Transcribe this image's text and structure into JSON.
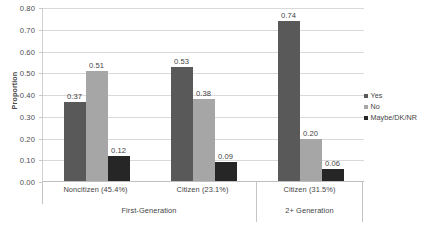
{
  "chart_data": {
    "type": "bar",
    "title": "",
    "subtitle": "",
    "xlabel": "",
    "ylabel": "Proportion",
    "ylim": [
      0.0,
      0.8
    ],
    "ytick_step": 0.1,
    "ytick_labels": [
      "0.80",
      "0.70",
      "0.60",
      "0.50",
      "0.40",
      "0.30",
      "0.20",
      "0.10",
      "0.00"
    ],
    "grid": true,
    "legend_position": "right",
    "categories": [
      "Noncitizen (45.4%)",
      "Citizen (23.1%)",
      "Citizen (31.5%)"
    ],
    "group_labels": [
      "First-Generation",
      "2+ Generation"
    ],
    "group_spans": [
      2,
      1
    ],
    "series": [
      {
        "name": "Yes",
        "color": "#595959",
        "values": [
          0.37,
          0.53,
          0.74
        ],
        "labels": [
          "0.37",
          "0.53",
          "0.74"
        ]
      },
      {
        "name": "No",
        "color": "#a6a6a6",
        "values": [
          0.51,
          0.38,
          0.2
        ],
        "labels": [
          "0.51",
          "0.38",
          "0.20"
        ]
      },
      {
        "name": "Maybe/DK/NR",
        "color": "#262626",
        "values": [
          0.12,
          0.09,
          0.06
        ],
        "labels": [
          "0.12",
          "0.09",
          "0.06"
        ]
      }
    ]
  },
  "legend": {
    "items": [
      {
        "label": "Yes",
        "color": "#595959"
      },
      {
        "label": "No",
        "color": "#a6a6a6"
      },
      {
        "label": "Maybe/DK/NR",
        "color": "#262626"
      }
    ]
  },
  "axes": {
    "y_title": "Proportion"
  }
}
